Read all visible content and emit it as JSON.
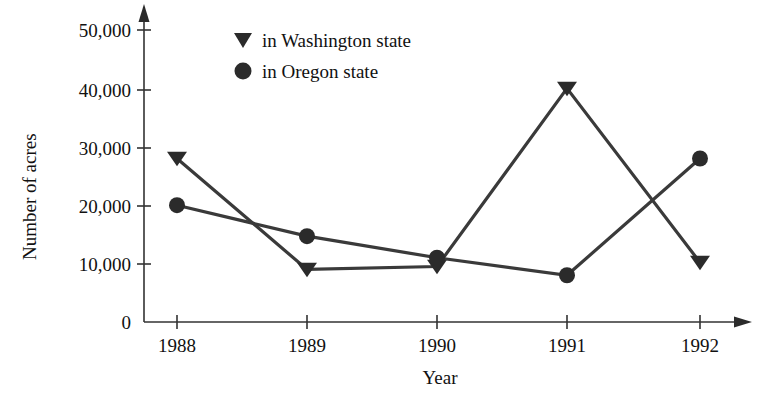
{
  "chart_data": {
    "type": "line",
    "title": "",
    "xlabel": "Year",
    "ylabel": "Number of acres",
    "categories": [
      "1988",
      "1989",
      "1990",
      "1991",
      "1992"
    ],
    "x": [
      1988,
      1989,
      1990,
      1991,
      1992
    ],
    "xlim": [
      1988,
      1992
    ],
    "ylim": [
      0,
      50000
    ],
    "grid": false,
    "legend_position": "top-center",
    "y_ticks": [
      "0",
      "10,000",
      "20,000",
      "30,000",
      "40,000",
      "50,000"
    ],
    "y_tick_values": [
      0,
      10000,
      20000,
      30000,
      40000,
      50000
    ],
    "series": [
      {
        "name": "in Washington state",
        "marker": "triangle-down",
        "color": "#2b2b2b",
        "values": [
          28000,
          9000,
          9500,
          40000,
          10200
        ]
      },
      {
        "name": "in Oregon state",
        "marker": "circle",
        "color": "#2b2b2b",
        "values": [
          20000,
          14700,
          11000,
          8000,
          28000
        ]
      }
    ]
  },
  "legend": {
    "items": [
      {
        "label": "in Washington state",
        "marker": "triangle-down-icon"
      },
      {
        "label": "in Oregon state",
        "marker": "circle-icon"
      }
    ]
  },
  "axes": {
    "y_title": "Number of acres",
    "x_title": "Year"
  }
}
